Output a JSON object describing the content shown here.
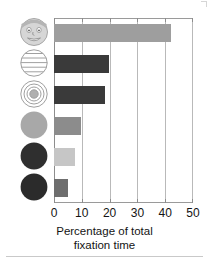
{
  "chart_data": {
    "type": "bar",
    "orientation": "horizontal",
    "title": "",
    "xlabel": "Percentage of total fixation time",
    "ylabel": "",
    "xlim": [
      0,
      50
    ],
    "xticks": [
      0,
      10,
      20,
      30,
      40,
      50
    ],
    "xtick_labels": [
      "0",
      "10",
      "20",
      "30",
      "40",
      "50"
    ],
    "grid": "vertical",
    "legend": "none",
    "categories": [
      "face-icon",
      "striped-circle-icon",
      "concentric-circles-icon",
      "medium-gray-circle-icon",
      "dark-circle-icon",
      "dark-circle-icon-2"
    ],
    "values": [
      42,
      19.7,
      18.5,
      9.8,
      7.5,
      5.2
    ],
    "bar_colors": [
      "#9e9e9e",
      "#3a3a3a",
      "#3a3a3a",
      "#8c8c8c",
      "#c6c6c6",
      "#6e6e6e"
    ]
  },
  "axis": {
    "title_line1": "Percentage of total",
    "title_line2": "fixation time"
  },
  "icons": [
    {
      "name": "face-icon",
      "label": "Schematic face",
      "fill": "#d4d4d4",
      "stroke": "#9a9a9a"
    },
    {
      "name": "striped-circle-icon",
      "label": "Horizontally striped circle",
      "fill": "#ffffff",
      "stroke": "#9a9a9a"
    },
    {
      "name": "concentric-circles-icon",
      "label": "Concentric circles (bullseye)",
      "fill": "#ffffff",
      "stroke": "#9a9a9a"
    },
    {
      "name": "medium-gray-circle-icon",
      "label": "Medium gray solid circle",
      "fill": "#a8a8a8",
      "stroke": "#a8a8a8"
    },
    {
      "name": "dark-circle-icon",
      "label": "Dark solid circle",
      "fill": "#2f2f2f",
      "stroke": "#2f2f2f"
    },
    {
      "name": "dark-circle-icon-2",
      "label": "Dark solid circle",
      "fill": "#2b2b2b",
      "stroke": "#2b2b2b"
    }
  ],
  "colors": {
    "background": "#ffffff",
    "grid": "#b9b9b9",
    "axis": "#8d8d8d",
    "text": "#141414"
  }
}
